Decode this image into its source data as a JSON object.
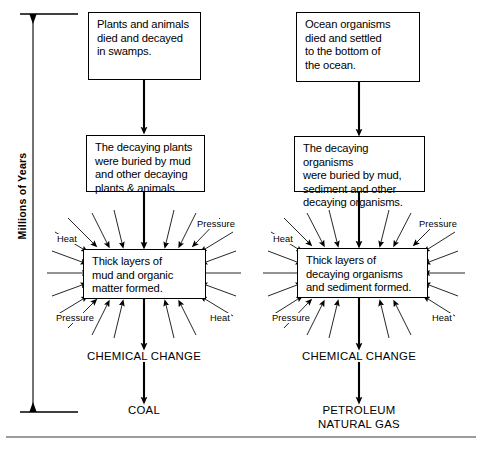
{
  "diagram": {
    "background_color": "#ffffff",
    "line_color": "#000000",
    "axis": {
      "label": "Millions of Years",
      "orientation": "vertical",
      "arrow_style": "double-headed"
    },
    "columns": [
      {
        "id": "coal",
        "steps": [
          "Plants and animals\ndied and decayed\nin swamps.",
          "The decaying plants\nwere buried by mud\nand other decaying\nplants & animals.",
          "Thick layers of\nmud and organic\nmatter formed."
        ],
        "process_label": "CHEMICAL CHANGE",
        "product": "COAL",
        "forces": [
          {
            "name": "Heat",
            "position": "top-left"
          },
          {
            "name": "Pressure",
            "position": "top-right"
          },
          {
            "name": "Pressure",
            "position": "bottom-left"
          },
          {
            "name": "Heat",
            "position": "bottom-right"
          }
        ]
      },
      {
        "id": "petroleum",
        "steps": [
          "Ocean organisms\ndied and settled\nto the bottom of\nthe ocean.",
          "The decaying organisms\nwere buried by mud,\nsediment and other\ndecaying organisms.",
          "Thick layers of\ndecaying organisms\nand sediment formed."
        ],
        "process_label": "CHEMICAL CHANGE",
        "product": "PETROLEUM\nNATURAL GAS",
        "forces": [
          {
            "name": "Heat",
            "position": "top-left"
          },
          {
            "name": "Pressure",
            "position": "top-right"
          },
          {
            "name": "Pressure",
            "position": "bottom-left"
          },
          {
            "name": "Heat",
            "position": "bottom-right"
          }
        ]
      }
    ]
  }
}
